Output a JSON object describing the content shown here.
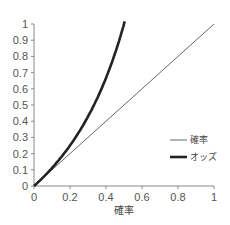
{
  "chart_data": {
    "type": "line",
    "title": "",
    "xlabel": "確率",
    "ylabel": "",
    "xlim": [
      0,
      1
    ],
    "ylim": [
      0,
      1
    ],
    "x_ticks": [
      "0",
      "0.2",
      "0.4",
      "0.6",
      "0.8",
      "1"
    ],
    "y_ticks": [
      "0",
      "0.1",
      "0.2",
      "0.3",
      "0.4",
      "0.5",
      "0.6",
      "0.7",
      "0.8",
      "0.9",
      "1"
    ],
    "grid": false,
    "legend_position": "right-middle",
    "series": [
      {
        "name": "確率",
        "style": "thin",
        "color": "#666666",
        "x": [
          0,
          0.1,
          0.2,
          0.3,
          0.4,
          0.5,
          0.6,
          0.7,
          0.8,
          0.9,
          1.0
        ],
        "values": [
          0,
          0.1,
          0.2,
          0.3,
          0.4,
          0.5,
          0.6,
          0.7,
          0.8,
          0.9,
          1.0
        ]
      },
      {
        "name": "オッズ",
        "style": "thick",
        "color": "#222222",
        "x": [
          0,
          0.05,
          0.1,
          0.15,
          0.2,
          0.25,
          0.3,
          0.35,
          0.4,
          0.45,
          0.5,
          0.51
        ],
        "values": [
          0,
          0.053,
          0.111,
          0.176,
          0.25,
          0.333,
          0.429,
          0.538,
          0.667,
          0.818,
          1.0,
          1.04
        ]
      }
    ]
  },
  "legend": {
    "items": [
      {
        "label": "確率",
        "line": "thin"
      },
      {
        "label": "オッズ",
        "line": "thick"
      }
    ]
  },
  "axes": {
    "xlabel": "確率"
  }
}
